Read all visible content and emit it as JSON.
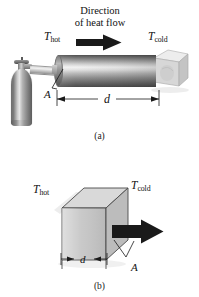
{
  "figure": {
    "background_color": "#ffffff",
    "width": 199,
    "height": 297
  },
  "panel_a": {
    "title_line1": "Direction",
    "title_line2": "of heat flow",
    "hot_label": "T",
    "hot_subscript": "hot",
    "cold_label": "T",
    "cold_subscript": "cold",
    "area_label": "A",
    "distance_label": "d",
    "caption": "(a)",
    "objects": {
      "gas_cylinder": "gas-cylinder-tank",
      "hose": "connecting-hose",
      "rod": "metal-rod",
      "ice_block": "ice-block",
      "heat_arrow": "heat-flow-arrow"
    }
  },
  "panel_b": {
    "hot_label": "T",
    "hot_subscript": "hot",
    "cold_label": "T",
    "cold_subscript": "cold",
    "area_label": "A",
    "distance_label": "d",
    "caption": "(b)",
    "objects": {
      "slab": "rectangular-slab",
      "heat_arrow": "heat-flow-arrow"
    }
  },
  "colors": {
    "arrow": "#1a1a1a",
    "rod_highlight": "#f2f2f2",
    "rod_dark": "#4a4a4a",
    "slab_front": "#c2c2c2",
    "slab_top": "#d8d8d8",
    "slab_side": "#cccccc",
    "ice": "#dcdcdc",
    "text": "#111111"
  }
}
